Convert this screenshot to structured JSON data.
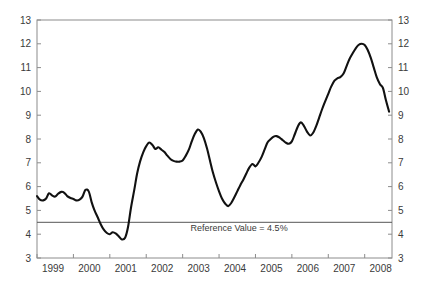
{
  "chart_data": {
    "type": "line",
    "title": "",
    "xlabel": "",
    "ylabel": "",
    "xlim": [
      1999.0,
      2008.75
    ],
    "ylim": [
      3,
      13
    ],
    "grid": false,
    "legend": "none",
    "y_ticks": [
      3,
      4,
      5,
      6,
      7,
      8,
      9,
      10,
      11,
      12,
      13
    ],
    "y_ticks_right": [
      3,
      4,
      5,
      6,
      7,
      8,
      9,
      10,
      11,
      12,
      13
    ],
    "x_ticks": [
      1999,
      2000,
      2001,
      2002,
      2003,
      2004,
      2005,
      2006,
      2007,
      2008
    ],
    "x_tick_labels": [
      "1999",
      "2000",
      "2001",
      "2002",
      "2003",
      "2004",
      "2005",
      "2006",
      "2007",
      "2008"
    ],
    "annotations": [
      {
        "text": "Reference Value = 4.5%",
        "x": 2004.55,
        "y": 4.12
      }
    ],
    "reference_line": {
      "value": 4.5,
      "label": "Reference Value = 4.5%",
      "color": "#555555"
    },
    "series": [
      {
        "name": "Monetary growth rate",
        "color": "#111111",
        "x": [
          1999.0,
          1999.08,
          1999.17,
          1999.25,
          1999.33,
          1999.42,
          1999.5,
          1999.58,
          1999.67,
          1999.75,
          1999.83,
          1999.92,
          2000.0,
          2000.08,
          2000.17,
          2000.25,
          2000.33,
          2000.42,
          2000.5,
          2000.58,
          2000.67,
          2000.75,
          2000.83,
          2000.92,
          2001.0,
          2001.08,
          2001.17,
          2001.25,
          2001.33,
          2001.42,
          2001.5,
          2001.58,
          2001.67,
          2001.75,
          2001.83,
          2001.92,
          2002.0,
          2002.08,
          2002.17,
          2002.25,
          2002.33,
          2002.42,
          2002.5,
          2002.58,
          2002.67,
          2002.75,
          2002.83,
          2002.92,
          2003.0,
          2003.08,
          2003.17,
          2003.25,
          2003.33,
          2003.42,
          2003.5,
          2003.58,
          2003.67,
          2003.75,
          2003.83,
          2003.92,
          2004.0,
          2004.08,
          2004.17,
          2004.25,
          2004.33,
          2004.42,
          2004.5,
          2004.58,
          2004.67,
          2004.75,
          2004.83,
          2004.92,
          2005.0,
          2005.08,
          2005.17,
          2005.25,
          2005.33,
          2005.42,
          2005.5,
          2005.58,
          2005.67,
          2005.75,
          2005.83,
          2005.92,
          2006.0,
          2006.08,
          2006.17,
          2006.25,
          2006.33,
          2006.42,
          2006.5,
          2006.58,
          2006.67,
          2006.75,
          2006.83,
          2006.92,
          2007.0,
          2007.08,
          2007.17,
          2007.25,
          2007.33,
          2007.42,
          2007.5,
          2007.58,
          2007.67,
          2007.75,
          2007.83,
          2007.92,
          2008.0,
          2008.08,
          2008.17,
          2008.25,
          2008.33,
          2008.42,
          2008.5,
          2008.58,
          2008.67
        ],
        "values": [
          5.6,
          5.45,
          5.42,
          5.5,
          5.72,
          5.62,
          5.58,
          5.7,
          5.78,
          5.74,
          5.6,
          5.52,
          5.48,
          5.42,
          5.45,
          5.58,
          5.86,
          5.8,
          5.35,
          5.0,
          4.7,
          4.42,
          4.2,
          4.05,
          4.0,
          4.08,
          4.02,
          3.9,
          3.78,
          3.85,
          4.3,
          5.1,
          5.85,
          6.55,
          7.05,
          7.45,
          7.7,
          7.85,
          7.75,
          7.58,
          7.65,
          7.55,
          7.45,
          7.3,
          7.15,
          7.08,
          7.05,
          7.05,
          7.1,
          7.28,
          7.55,
          7.9,
          8.2,
          8.4,
          8.3,
          8.05,
          7.6,
          7.1,
          6.6,
          6.15,
          5.8,
          5.5,
          5.28,
          5.18,
          5.3,
          5.55,
          5.8,
          6.05,
          6.3,
          6.55,
          6.8,
          6.95,
          6.85,
          7.0,
          7.25,
          7.55,
          7.85,
          8.0,
          8.1,
          8.12,
          8.05,
          7.95,
          7.85,
          7.8,
          7.9,
          8.2,
          8.55,
          8.7,
          8.55,
          8.3,
          8.15,
          8.25,
          8.55,
          8.9,
          9.25,
          9.6,
          9.9,
          10.2,
          10.45,
          10.55,
          10.6,
          10.75,
          11.05,
          11.35,
          11.6,
          11.8,
          11.95,
          12.0,
          11.95,
          11.75,
          11.4,
          11.0,
          10.6,
          10.3,
          10.15,
          9.65,
          9.15
        ]
      }
    ]
  }
}
